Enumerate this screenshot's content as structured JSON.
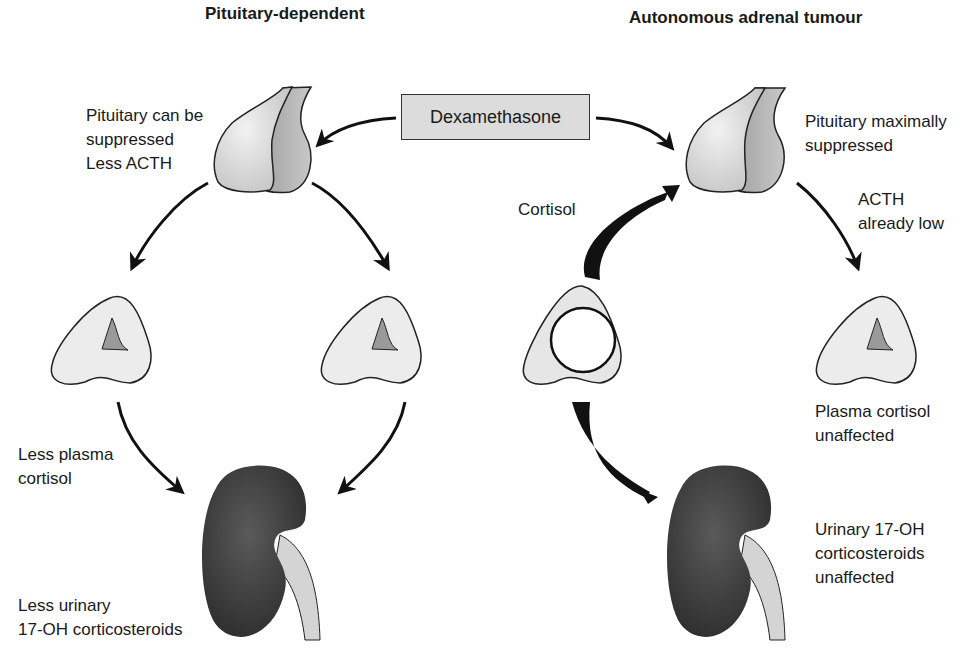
{
  "left_panel": {
    "title": "Pituitary-dependent",
    "pituitary_label": "Pituitary can be\nsuppressed\nLess ACTH",
    "plasma_label": "Less plasma\ncortisol",
    "urinary_label": "Less urinary\n17-OH corticosteroids"
  },
  "right_panel": {
    "title": "Autonomous adrenal tumour",
    "pituitary_label": "Pituitary maximally\nsuppressed",
    "acth_label": "ACTH\nalready low",
    "cortisol_label": "Cortisol",
    "plasma_label": "Plasma cortisol\nunaffected",
    "urinary_label": "Urinary 17-OH\ncorticosteroids\nunaffected"
  },
  "center": {
    "drug_box": "Dexamethasone"
  },
  "colors": {
    "pituitary_light": "#d9d9d9",
    "pituitary_dark": "#b0b0b0",
    "adrenal_fill": "#ececec",
    "adrenal_core": "#9a9a9a",
    "kidney": "#3c3c3c",
    "ureter": "#d4d4d4",
    "box_fill": "#dcdcdc"
  }
}
